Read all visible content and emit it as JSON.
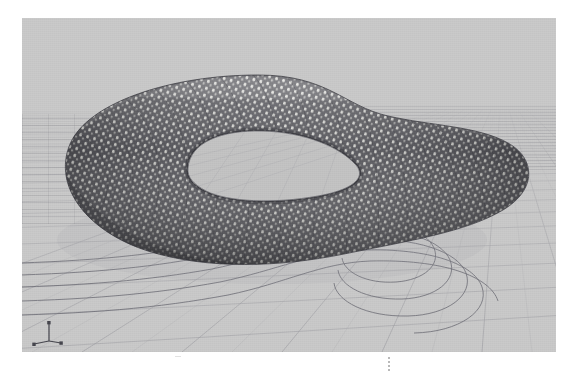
{
  "document": {
    "width": 572,
    "height": 377,
    "background_color": "#ffffff",
    "figure_type": "3d-viewport-render"
  },
  "viewport": {
    "name": "3d-model-viewport",
    "x": 22,
    "y": 18,
    "width": 534,
    "height": 334,
    "background_color": "#c9c9c9",
    "projection": "perspective",
    "shading_mode": "shaded-wireframe",
    "display_units": "",
    "label": ""
  },
  "axis_gizmo": {
    "name": "xyz-axis-indicator",
    "position": "bottom-left",
    "x_label": "x",
    "y_label": "y",
    "z_label": "z",
    "color": "#4a4a52"
  },
  "ground_plane": {
    "name": "construction-grid",
    "grid_color": "#9a9aa2",
    "grid_spacing_major": 58,
    "grid_spacing_minor": 14,
    "horizon_y": 92,
    "vanishing_x": 470
  },
  "model": {
    "name": "mobius-loop-tube",
    "geometry": "closed looped tube / mobius band",
    "surface_color_dark": "#4d4d52",
    "surface_color_light": "#d2d2d0",
    "edge_color": "#3a3a3e",
    "pattern": "perforated-woven-lattice",
    "pattern_cols": 140,
    "pattern_rows": 26,
    "hole_shape": "teardrop",
    "hole_fill": "#c4c4c4"
  },
  "projection_curves": {
    "name": "ground-projection-contours",
    "color": "#6e6e78",
    "count": 5,
    "description": "nested contour offsets of the model silhouette projected onto the ground plane"
  },
  "annotations": {
    "caption_marker": "",
    "tick_marker": ""
  },
  "chart_data": {
    "type": "scatter",
    "title": "",
    "xlabel": "",
    "ylabel": "",
    "categories": [],
    "values": []
  }
}
